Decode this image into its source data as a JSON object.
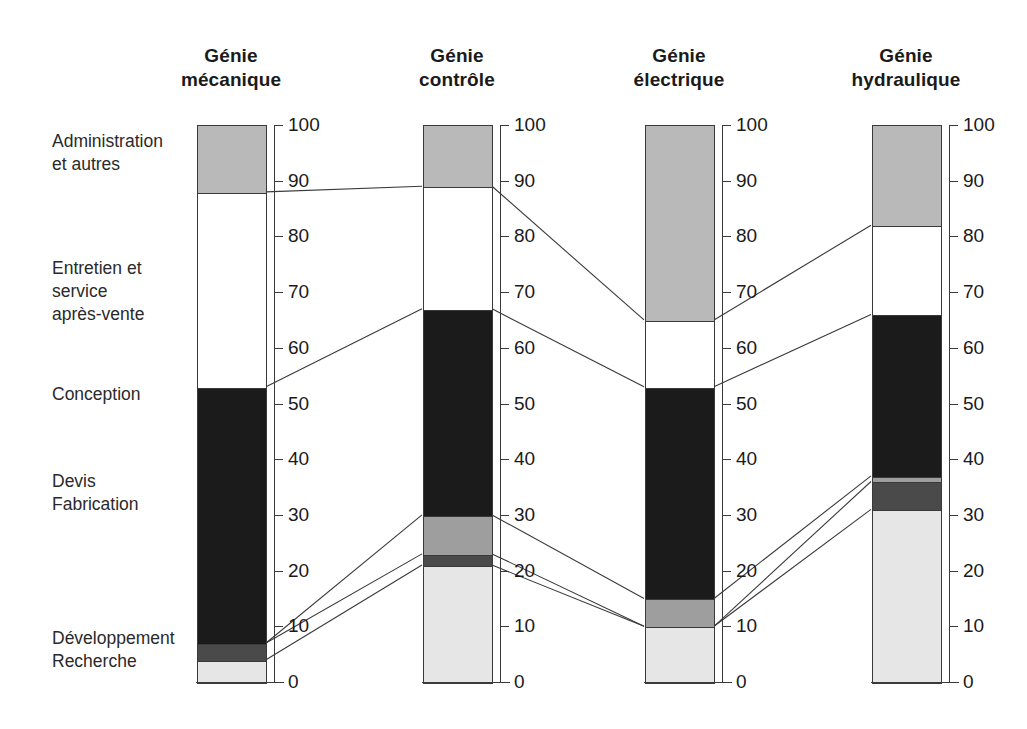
{
  "chart_data": {
    "type": "bar",
    "subtype": "stacked-100-percent",
    "title": "",
    "xlabel": "",
    "ylabel": "",
    "ylim": [
      0,
      100
    ],
    "grid": false,
    "legend_position": "left-row-labels",
    "tick_labels": [
      "0",
      "10",
      "20",
      "30",
      "40",
      "50",
      "60",
      "70",
      "80",
      "90",
      "100"
    ],
    "tick_values": [
      0,
      10,
      20,
      30,
      40,
      50,
      60,
      70,
      80,
      90,
      100
    ],
    "categories": [
      "Génie mécanique",
      "Génie contrôle",
      "Génie électrique",
      "Génie hydraulique"
    ],
    "category_lines": [
      [
        "Génie",
        "mécanique"
      ],
      [
        "Génie",
        "contrôle"
      ],
      [
        "Génie",
        "électrique"
      ],
      [
        "Génie",
        "hydraulique"
      ]
    ],
    "series": [
      {
        "name": "Administration et autres",
        "values": [
          12,
          11,
          35,
          18
        ],
        "color": "#b9b9b9"
      },
      {
        "name": "Entretien et service après-vente",
        "values": [
          35,
          22,
          12,
          16
        ],
        "color": "#ffffff"
      },
      {
        "name": "Conception",
        "values": [
          46,
          37,
          38,
          29
        ],
        "color": "#1b1b1b"
      },
      {
        "name": "Devis",
        "values": [
          0,
          7,
          5,
          1
        ],
        "color": "#9e9e9e"
      },
      {
        "name": "Fabrication",
        "values": [
          3,
          2,
          0,
          5
        ],
        "color": "#4a4a4a"
      },
      {
        "name": "Développement Recherche",
        "values": [
          4,
          21,
          10,
          31
        ],
        "color": "#e6e6e6"
      }
    ],
    "cumulative_boundaries": [
      [
        0,
        4,
        7,
        7,
        53,
        88,
        100
      ],
      [
        0,
        21,
        23,
        30,
        67,
        89,
        100
      ],
      [
        0,
        10,
        10,
        15,
        53,
        65,
        100
      ],
      [
        0,
        31,
        36,
        37,
        66,
        82,
        100
      ]
    ]
  },
  "row_labels": [
    {
      "id": "administration",
      "lines": [
        "Administration",
        "et autres"
      ],
      "top": 130
    },
    {
      "id": "entretien",
      "lines": [
        "Entretien et",
        "service",
        "après-vente"
      ],
      "top": 257
    },
    {
      "id": "conception",
      "lines": [
        "Conception"
      ],
      "top": 383
    },
    {
      "id": "devis-fabrication",
      "lines": [
        "Devis",
        "Fabrication"
      ],
      "top": 470
    },
    {
      "id": "developpement",
      "lines": [
        "Développement",
        "Recherche"
      ],
      "top": 627
    }
  ],
  "headers": [
    {
      "id": "genie-mecanique",
      "line1": "Génie",
      "line2": "mécanique"
    },
    {
      "id": "genie-controle",
      "line1": "Génie",
      "line2": "contrôle"
    },
    {
      "id": "genie-electrique",
      "line1": "Génie",
      "line2": "électrique"
    },
    {
      "id": "genie-hydraulique",
      "line1": "Génie",
      "line2": "hydraulique"
    }
  ],
  "colors": {
    "administration": "#b9b9b9",
    "entretien": "#ffffff",
    "conception": "#1b1b1b",
    "devis": "#9e9e9e",
    "fabrication": "#4a4a4a",
    "developpement": "#e6e6e6",
    "stroke": "#3a3a3a",
    "text": "#1a1a1a"
  }
}
